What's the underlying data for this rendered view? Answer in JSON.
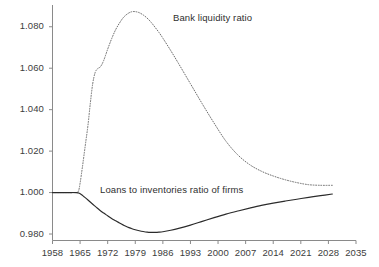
{
  "chart_data": {
    "type": "line",
    "title": "",
    "subtitle": "",
    "xlabel": "",
    "ylabel": "",
    "xlim": [
      1958,
      2035
    ],
    "ylim": [
      0.9735,
      1.0905
    ],
    "grid": false,
    "legend_position": "inline-annotations",
    "xticks": [
      "1958",
      "1965",
      "1972",
      "1979",
      "1986",
      "1993",
      "2000",
      "2007",
      "2014",
      "2021",
      "2028",
      "2035"
    ],
    "xtick_values": [
      1958,
      1965,
      1972,
      1979,
      1986,
      1993,
      2000,
      2007,
      2014,
      2021,
      2028,
      2035
    ],
    "yticks": [
      "0.980",
      "1.000",
      "1.020",
      "1.040",
      "1.060",
      "1.080"
    ],
    "ytick_values": [
      0.98,
      1.0,
      1.02,
      1.04,
      1.06,
      1.08
    ],
    "series": [
      {
        "name": "Bank liquidity ratio",
        "style": "dotted",
        "color": "#6e6e6e",
        "annotation": "Bank liquidity ratio",
        "x": [
          1958,
          1960,
          1962,
          1964,
          1964.6,
          1965,
          1965.6,
          1966.3,
          1967,
          1967.6,
          1968.2,
          1968.8,
          1969.4,
          1970.2,
          1971,
          1972,
          1973,
          1974,
          1975,
          1976,
          1977,
          1978,
          1979,
          1980,
          1981,
          1982,
          1983,
          1984,
          1985,
          1986,
          1988,
          1990,
          1993,
          1996,
          1999,
          2002,
          2005,
          2008,
          2011,
          2014,
          2017,
          2020,
          2023,
          2026,
          2029
        ],
        "y": [
          1.0,
          1.0,
          1.0,
          1.0,
          1.0008,
          1.0045,
          1.0125,
          1.0225,
          1.0325,
          1.0432,
          1.0525,
          1.0578,
          1.0597,
          1.0608,
          1.0638,
          1.0692,
          1.0742,
          1.0785,
          1.0818,
          1.0845,
          1.0862,
          1.0872,
          1.0873,
          1.0868,
          1.0857,
          1.0842,
          1.0822,
          1.0798,
          1.0773,
          1.0745,
          1.0685,
          1.0622,
          1.0525,
          1.0428,
          1.0335,
          1.0248,
          1.0182,
          1.0135,
          1.0103,
          1.008,
          1.0062,
          1.0048,
          1.0038,
          1.0035,
          1.0035
        ]
      },
      {
        "name": "Loans to inventories ratio of firms",
        "style": "solid",
        "color": "#2b2b2b",
        "annotation": "Loans to inventories ratio of firms",
        "x": [
          1958,
          1960,
          1962,
          1964,
          1964.6,
          1965.3,
          1966,
          1967,
          1968,
          1969,
          1970,
          1971,
          1972,
          1973,
          1974,
          1975,
          1976,
          1977,
          1978,
          1979,
          1980,
          1981,
          1982,
          1983,
          1984,
          1985,
          1986,
          1988,
          1990,
          1993,
          1996,
          1999,
          2002,
          2005,
          2008,
          2011,
          2014,
          2017,
          2020,
          2023,
          2026,
          2029
        ],
        "y": [
          1.0,
          1.0,
          1.0,
          1.0,
          0.9998,
          0.9991,
          0.998,
          0.9964,
          0.9947,
          0.9931,
          0.9915,
          0.9901,
          0.9888,
          0.9875,
          0.9864,
          0.9853,
          0.9843,
          0.9834,
          0.9827,
          0.9821,
          0.9816,
          0.9812,
          0.9809,
          0.9808,
          0.9808,
          0.9809,
          0.9811,
          0.9818,
          0.9827,
          0.9843,
          0.9861,
          0.9879,
          0.9896,
          0.9911,
          0.9925,
          0.9938,
          0.9949,
          0.9959,
          0.9968,
          0.9977,
          0.9985,
          0.9993
        ]
      }
    ]
  },
  "axis": {
    "y_axis_name": "y-axis",
    "x_axis_name": "x-axis"
  }
}
